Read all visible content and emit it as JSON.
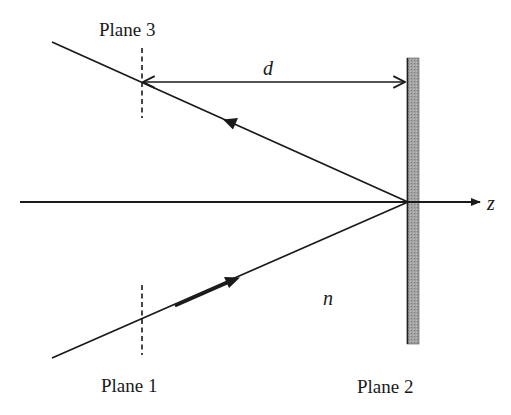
{
  "diagram": {
    "title": "",
    "labels": {
      "plane1": "Plane 1",
      "plane2": "Plane 2",
      "plane3": "Plane 3",
      "distance": "d",
      "index": "n",
      "axis": "z"
    },
    "colors": {
      "ink": "#1a1a1a",
      "mirror_fill": "#9a9a9a",
      "mirror_edge": "#333333",
      "background": "#ffffff"
    },
    "geometry": {
      "axis": {
        "x1": 20,
        "y": 202,
        "x2": 482
      },
      "mirror": {
        "x": 407,
        "y1": 58,
        "y2": 344,
        "width": 12
      },
      "vertex": {
        "x": 408,
        "y": 202
      },
      "incident_ray": {
        "from": [
          52,
          358
        ],
        "to": [
          408,
          202
        ]
      },
      "reflected_ray": {
        "from": [
          408,
          202
        ],
        "to": [
          52,
          42
        ]
      },
      "plane1_marker": {
        "x": 142,
        "y1": 285,
        "y2": 355
      },
      "plane3_marker": {
        "x": 142,
        "y1": 48,
        "y2": 118
      },
      "distance_arrow": {
        "x1": 142,
        "x2": 406,
        "y": 82
      }
    }
  }
}
